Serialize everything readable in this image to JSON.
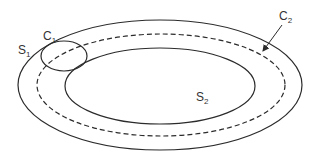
{
  "diagram": {
    "type": "nested-regions",
    "colors": {
      "stroke": "#2b2b2b",
      "background": "#ffffff",
      "text": "#333333"
    },
    "shapes": {
      "outer_boundary": {
        "cx": 160,
        "cy": 85,
        "rx": 142,
        "ry": 65,
        "style": "solid"
      },
      "dashed_curve": {
        "cx": 161,
        "cy": 85,
        "rx": 124,
        "ry": 51,
        "style": "dashed",
        "name": "C2"
      },
      "inner_boundary": {
        "cx": 160,
        "cy": 86,
        "rx": 95,
        "ry": 38,
        "style": "solid",
        "name": "S2"
      },
      "small_circle": {
        "cx": 64,
        "cy": 56,
        "rx": 23,
        "ry": 15,
        "style": "solid",
        "name": "C1"
      }
    },
    "labels": {
      "s1": {
        "base": "S",
        "sub": "1"
      },
      "c1": {
        "base": "C",
        "sub": "1"
      },
      "c2": {
        "base": "C",
        "sub": "2"
      },
      "s2": {
        "base": "S",
        "sub": "2"
      }
    },
    "arrow": {
      "from": "C2 label",
      "to": "dashed curve C2"
    }
  }
}
